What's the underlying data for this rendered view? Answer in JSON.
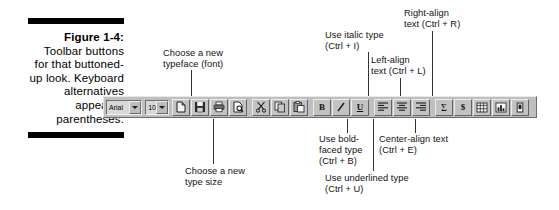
{
  "caption": {
    "figure_label": "Figure 1-4:",
    "body": "Toolbar buttons for that buttoned-up look. Keyboard alternatives appear in parentheses."
  },
  "annotations": [
    {
      "name": "choose-typeface",
      "text": "Choose a new\ntypeface (font)"
    },
    {
      "name": "choose-type-size",
      "text": "Choose a new\ntype size"
    },
    {
      "name": "use-italic",
      "text": "Use italic type\n(Ctrl + I)"
    },
    {
      "name": "left-align",
      "text": "Left-align\ntext (Ctrl + L)"
    },
    {
      "name": "right-align",
      "text": "Right-align\ntext (Ctrl + R)"
    },
    {
      "name": "use-bold",
      "text": "Use bold-\nfaced type\n(Ctrl + B)"
    },
    {
      "name": "center-align",
      "text": "Center-align text\n(Ctrl + E)"
    },
    {
      "name": "use-underline",
      "text": "Use underlined type\n(Ctrl + U)"
    }
  ],
  "toolbar": {
    "font_combo": {
      "value": "Arial",
      "icon": "chevron-down-icon"
    },
    "size_combo": {
      "value": "10",
      "icon": "chevron-down-icon"
    },
    "groups": [
      {
        "name": "file-group",
        "buttons": [
          {
            "name": "new-document-button",
            "icon": "new-document-icon"
          },
          {
            "name": "save-button",
            "icon": "floppy-disk-icon"
          },
          {
            "name": "print-button",
            "icon": "printer-icon"
          },
          {
            "name": "print-preview-button",
            "icon": "print-preview-icon"
          }
        ]
      },
      {
        "name": "clipboard-group",
        "buttons": [
          {
            "name": "cut-button",
            "icon": "scissors-icon"
          },
          {
            "name": "copy-button",
            "icon": "copy-icon"
          },
          {
            "name": "paste-button",
            "icon": "paste-icon"
          }
        ]
      },
      {
        "name": "font-style-group",
        "buttons": [
          {
            "name": "bold-button",
            "icon": "bold-icon",
            "glyph": "B"
          },
          {
            "name": "italic-button",
            "icon": "italic-icon",
            "glyph": "I"
          },
          {
            "name": "underline-button",
            "icon": "underline-icon",
            "glyph": "U"
          }
        ]
      },
      {
        "name": "alignment-group",
        "buttons": [
          {
            "name": "align-left-button",
            "icon": "align-left-icon"
          },
          {
            "name": "align-center-button",
            "icon": "align-center-icon"
          },
          {
            "name": "align-right-button",
            "icon": "align-right-icon"
          }
        ]
      },
      {
        "name": "data-group",
        "buttons": [
          {
            "name": "autosum-button",
            "icon": "sigma-icon",
            "glyph": "Σ"
          },
          {
            "name": "currency-button",
            "icon": "dollar-icon",
            "glyph": "$"
          },
          {
            "name": "spreadsheet-button",
            "icon": "spreadsheet-icon"
          },
          {
            "name": "chart-button",
            "icon": "bar-chart-icon"
          },
          {
            "name": "drawing-button",
            "icon": "drawing-icon"
          }
        ]
      }
    ]
  },
  "colors": {
    "toolbar_face": "#bfbfbf",
    "button_face": "#c2c2c2",
    "highlight": "#ececec",
    "shadow": "#636363",
    "ink": "#111111"
  }
}
